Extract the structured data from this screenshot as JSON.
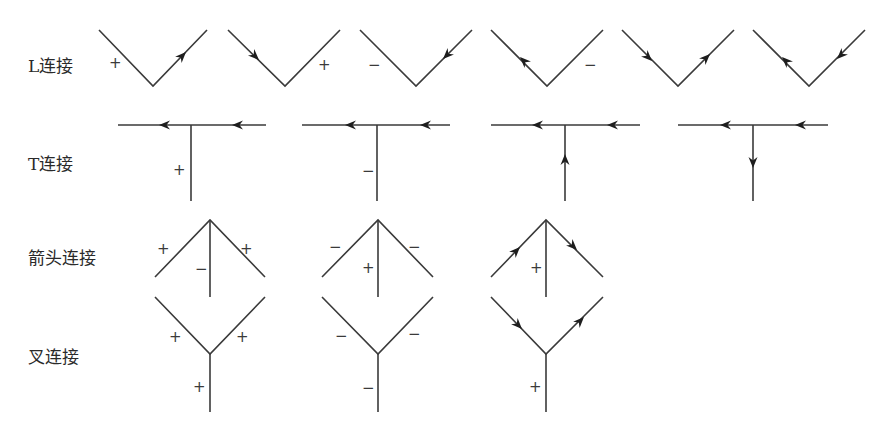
{
  "colors": {
    "line": "#3a3a3a",
    "arrow": "#1e1e1e",
    "text": "#2a2a2a",
    "background": "#ffffff"
  },
  "rows": [
    {
      "id": "L",
      "label": "L连接",
      "junction_count": 6
    },
    {
      "id": "T",
      "label": "T连接",
      "junction_count": 4
    },
    {
      "id": "arrow",
      "label": "箭头连接",
      "junction_count": 3
    },
    {
      "id": "fork",
      "label": "叉连接",
      "junction_count": 3
    }
  ],
  "junctions": {
    "L": [
      {
        "left_edge": "+",
        "right_edge": "arrow up-right (outward)"
      },
      {
        "left_edge": "arrow down-right (toward vertex)",
        "right_edge": "+"
      },
      {
        "left_edge": "−",
        "right_edge": "arrow down-left (toward vertex)"
      },
      {
        "left_edge": "arrow up-left (outward)",
        "right_edge": "−"
      },
      {
        "left_edge": "arrow down-right (toward vertex)",
        "right_edge": "arrow up-right (outward)"
      },
      {
        "left_edge": "arrow up-left (outward)",
        "right_edge": "arrow down-left (toward vertex)"
      }
    ],
    "T": [
      {
        "top_bar": "arrows pointing left",
        "stem": "+"
      },
      {
        "top_bar": "arrows pointing left",
        "stem": "−"
      },
      {
        "top_bar": "arrows pointing left",
        "stem": "arrow up"
      },
      {
        "top_bar": "arrows pointing left",
        "stem": "arrow down"
      }
    ],
    "arrow": [
      {
        "left_edge": "+",
        "right_edge": "+",
        "stem": "−"
      },
      {
        "left_edge": "−",
        "right_edge": "−",
        "stem": "+"
      },
      {
        "left_edge": "arrow up-right",
        "right_edge": "arrow down-right",
        "stem": "+"
      }
    ],
    "fork": [
      {
        "left_edge": "+",
        "right_edge": "+",
        "stem": "+"
      },
      {
        "left_edge": "−",
        "right_edge": "−",
        "stem": "−"
      },
      {
        "left_edge": "arrow down-right",
        "right_edge": "arrow up-right",
        "stem": "+"
      }
    ]
  },
  "signs": {
    "plus": "+",
    "minus": "−"
  }
}
